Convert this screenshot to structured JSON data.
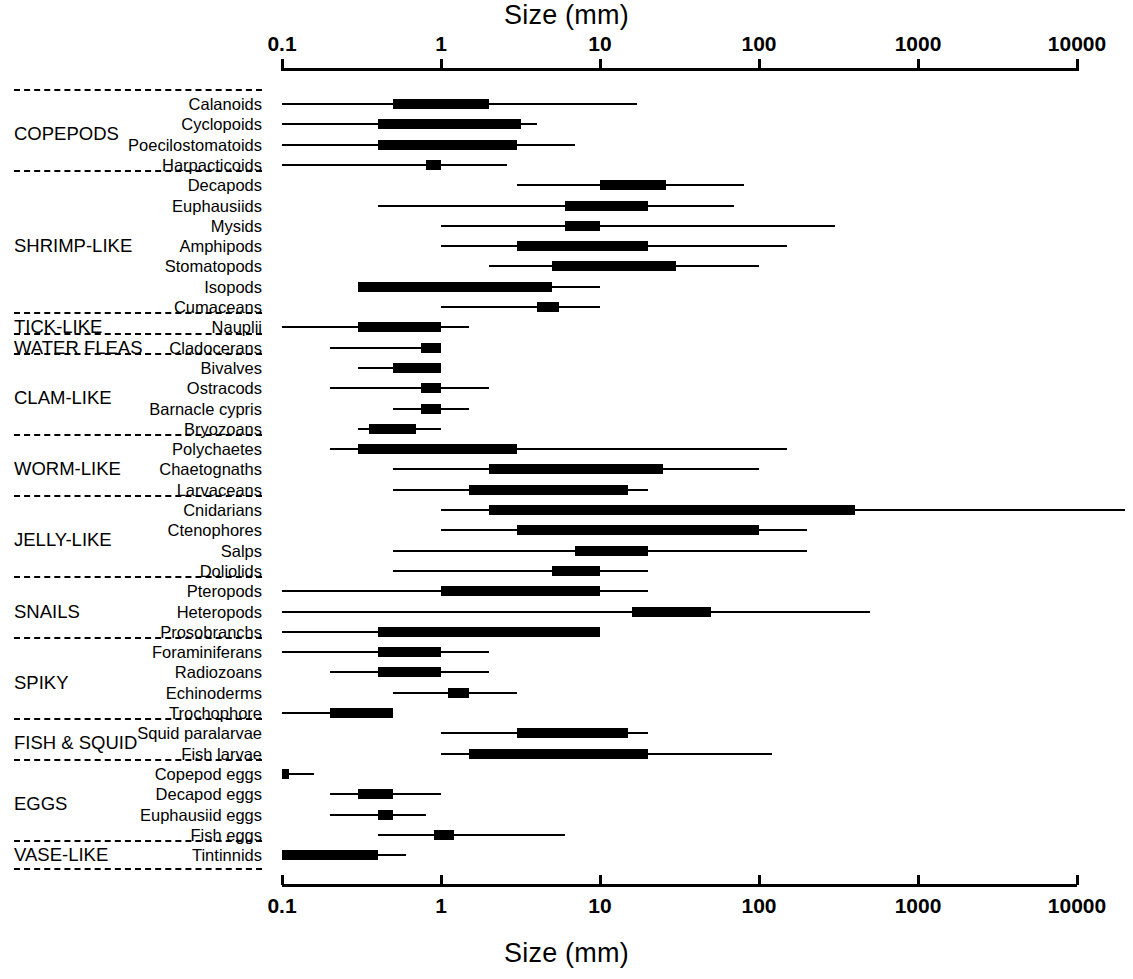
{
  "axis": {
    "title": "Size (mm)",
    "ticks": [
      0.1,
      1,
      10,
      100,
      1000,
      10000
    ],
    "tick_labels": [
      "0.1",
      "1",
      "10",
      "100",
      "1000",
      "10000"
    ],
    "scale": "log",
    "min": 0.1,
    "max": 10000
  },
  "groups": [
    {
      "name": "COPEPODS",
      "first": 0,
      "last": 3
    },
    {
      "name": "SHRIMP-LIKE",
      "first": 4,
      "last": 10
    },
    {
      "name": "TICK-LIKE",
      "first": 11,
      "last": 11
    },
    {
      "name": "WATER FLEAS",
      "first": 12,
      "last": 12
    },
    {
      "name": "CLAM-LIKE",
      "first": 13,
      "last": 16
    },
    {
      "name": "WORM-LIKE",
      "first": 17,
      "last": 19
    },
    {
      "name": "JELLY-LIKE",
      "first": 20,
      "last": 23
    },
    {
      "name": "SNAILS",
      "first": 24,
      "last": 26
    },
    {
      "name": "SPIKY",
      "first": 27,
      "last": 30
    },
    {
      "name": "FISH & SQUID",
      "first": 31,
      "last": 32
    },
    {
      "name": "EGGS",
      "first": 33,
      "last": 36
    },
    {
      "name": "VASE-LIKE",
      "first": 37,
      "last": 37
    }
  ],
  "chart_data": {
    "type": "bar",
    "title": "Size (mm)",
    "xlabel": "Size (mm)",
    "ylabel": "",
    "xscale": "log",
    "xlim": [
      0.1,
      10000
    ],
    "grid": false,
    "legend": "none",
    "categories": [
      "Calanoids",
      "Cyclopoids",
      "Poecilostomatoids",
      "Harpacticoids",
      "Decapods",
      "Euphausiids",
      "Mysids",
      "Amphipods",
      "Stomatopods",
      "Isopods",
      "Cumaceans",
      "Nauplii",
      "Cladocerans",
      "Bivalves",
      "Ostracods",
      "Barnacle cypris",
      "Bryozoans",
      "Polychaetes",
      "Chaetognaths",
      "Larvaceans",
      "Cnidarians",
      "Ctenophores",
      "Salps",
      "Doliolids",
      "Pteropods",
      "Heteropods",
      "Prosobranchs",
      "Foraminiferans",
      "Radiozoans",
      "Echinoderms",
      "Trochophore",
      "Squid paralarvae",
      "Fish  larvae",
      "Copepod eggs",
      "Decapod eggs",
      "Euphausiid eggs",
      "Fish eggs",
      "Tintinnids"
    ],
    "series": [
      {
        "name": "full range min",
        "values": [
          0.1,
          0.1,
          0.1,
          0.1,
          3.0,
          0.4,
          1.0,
          1.0,
          2.0,
          0.3,
          1.0,
          0.1,
          0.2,
          0.3,
          0.2,
          0.5,
          0.3,
          0.2,
          0.5,
          0.5,
          1.0,
          1.0,
          0.5,
          0.5,
          0.1,
          0.1,
          0.1,
          0.1,
          0.2,
          0.5,
          0.1,
          1.0,
          1.0,
          0.1,
          0.2,
          0.2,
          0.4,
          0.1
        ]
      },
      {
        "name": "full range max",
        "values": [
          17.0,
          4.0,
          7.0,
          2.6,
          80.0,
          70.0,
          300.0,
          150.0,
          100.0,
          10.0,
          10.0,
          1.5,
          1.0,
          1.0,
          2.0,
          1.5,
          1.0,
          150.0,
          100.0,
          20.0,
          20000.0,
          200.0,
          200.0,
          20.0,
          20.0,
          500.0,
          10.0,
          2.0,
          2.0,
          3.0,
          0.5,
          20.0,
          120.0,
          0.16,
          1.0,
          0.8,
          6.0,
          0.6
        ]
      },
      {
        "name": "common range min",
        "values": [
          0.5,
          0.4,
          0.4,
          0.8,
          10.0,
          6.0,
          6.0,
          3.0,
          5.0,
          0.3,
          4.0,
          0.3,
          0.75,
          0.5,
          0.75,
          0.75,
          0.35,
          0.3,
          2.0,
          1.5,
          2.0,
          3.0,
          7.0,
          5.0,
          1.0,
          16.0,
          0.4,
          0.4,
          0.4,
          1.1,
          0.2,
          3.0,
          1.5,
          0.1,
          0.3,
          0.4,
          0.9,
          0.1
        ]
      },
      {
        "name": "common range max",
        "values": [
          2.0,
          3.2,
          3.0,
          1.0,
          26.0,
          20.0,
          10.0,
          20.0,
          30.0,
          5.0,
          5.5,
          1.0,
          1.0,
          1.0,
          1.0,
          1.0,
          0.7,
          3.0,
          25.0,
          15.0,
          400.0,
          100.0,
          20.0,
          10.0,
          10.0,
          50.0,
          10.0,
          1.0,
          1.0,
          1.5,
          0.5,
          15.0,
          20.0,
          0.11,
          0.5,
          0.5,
          1.2,
          0.4
        ]
      }
    ],
    "overflow_right": [
      "Cnidarians"
    ]
  }
}
